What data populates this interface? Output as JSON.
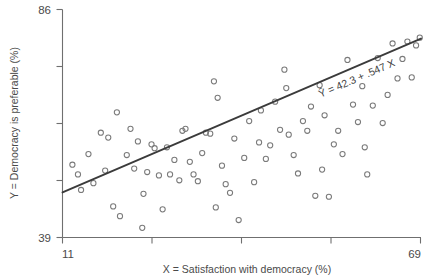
{
  "chart_data": {
    "type": "scatter",
    "title": "",
    "xlabel": "X = Satisfaction with democracy (%)",
    "ylabel": "Y = Democracy is preferable (%)",
    "xlim": [
      11,
      69
    ],
    "ylim": [
      39,
      86
    ],
    "xticks": [
      11,
      25.5,
      40,
      54.5,
      69
    ],
    "yticks": [
      39,
      50.75,
      62.5,
      74.25,
      86
    ],
    "xtick_labels": [
      "11",
      "",
      "",
      "",
      "69"
    ],
    "ytick_labels": [
      "39",
      "",
      "",
      "",
      "86"
    ],
    "grid": false,
    "legend": "none",
    "marker": "open-circle",
    "annotation": "Ŷ = 42.3 + .547 X",
    "regression": {
      "intercept": 42.3,
      "slope": 0.547,
      "x_start": 11,
      "x_end": 69,
      "y_start": 48.3,
      "y_end": 80.0
    },
    "points": [
      [
        13.5,
        52.0
      ],
      [
        14.0,
        48.8
      ],
      [
        15.2,
        56.2
      ],
      [
        16.0,
        50.2
      ],
      [
        17.2,
        60.6
      ],
      [
        18.4,
        59.6
      ],
      [
        17.9,
        52.8
      ],
      [
        19.2,
        45.4
      ],
      [
        20.3,
        43.4
      ],
      [
        21.4,
        56.0
      ],
      [
        22.0,
        61.4
      ],
      [
        22.6,
        53.2
      ],
      [
        23.2,
        58.8
      ],
      [
        23.9,
        41.0
      ],
      [
        24.7,
        52.5
      ],
      [
        25.4,
        58.2
      ],
      [
        25.9,
        57.4
      ],
      [
        26.6,
        51.8
      ],
      [
        27.2,
        44.8
      ],
      [
        27.9,
        57.6
      ],
      [
        28.4,
        52.0
      ],
      [
        29.1,
        55.0
      ],
      [
        29.9,
        50.8
      ],
      [
        30.4,
        61.0
      ],
      [
        30.9,
        61.4
      ],
      [
        31.6,
        54.6
      ],
      [
        32.2,
        52.0
      ],
      [
        32.9,
        50.6
      ],
      [
        33.6,
        56.4
      ],
      [
        34.2,
        60.6
      ],
      [
        34.9,
        60.4
      ],
      [
        35.5,
        71.2
      ],
      [
        36.1,
        67.8
      ],
      [
        36.8,
        53.8
      ],
      [
        37.4,
        50.0
      ],
      [
        38.1,
        48.2
      ],
      [
        38.8,
        59.4
      ],
      [
        39.5,
        42.6
      ],
      [
        40.4,
        55.4
      ],
      [
        41.2,
        63.0
      ],
      [
        42.0,
        50.4
      ],
      [
        43.1,
        65.2
      ],
      [
        43.9,
        55.2
      ],
      [
        44.6,
        58.0
      ],
      [
        45.4,
        67.0
      ],
      [
        46.2,
        61.2
      ],
      [
        46.9,
        73.6
      ],
      [
        47.6,
        60.2
      ],
      [
        48.4,
        56.0
      ],
      [
        49.1,
        52.2
      ],
      [
        49.9,
        63.0
      ],
      [
        50.6,
        61.0
      ],
      [
        51.2,
        66.0
      ],
      [
        51.9,
        47.6
      ],
      [
        52.6,
        70.4
      ],
      [
        53.4,
        64.2
      ],
      [
        54.1,
        47.4
      ],
      [
        54.9,
        58.2
      ],
      [
        55.6,
        61.0
      ],
      [
        56.3,
        56.2
      ],
      [
        57.1,
        75.6
      ],
      [
        58.0,
        66.4
      ],
      [
        58.8,
        62.8
      ],
      [
        59.5,
        70.2
      ],
      [
        60.3,
        52.0
      ],
      [
        61.2,
        66.2
      ],
      [
        62.0,
        76.0
      ],
      [
        62.8,
        62.6
      ],
      [
        63.6,
        68.4
      ],
      [
        64.4,
        79.0
      ],
      [
        65.2,
        71.8
      ],
      [
        66.0,
        75.8
      ],
      [
        66.8,
        79.4
      ],
      [
        67.5,
        72.0
      ],
      [
        68.2,
        78.6
      ],
      [
        68.8,
        80.2
      ],
      [
        12.6,
        54.0
      ],
      [
        19.8,
        64.8
      ],
      [
        24.1,
        48.0
      ],
      [
        35.8,
        45.2
      ],
      [
        42.8,
        58.6
      ],
      [
        47.2,
        69.8
      ],
      [
        53.0,
        53.0
      ],
      [
        59.9,
        57.6
      ]
    ]
  },
  "axis": {
    "x_min_label": "11",
    "x_max_label": "69",
    "y_min_label": "39",
    "y_max_label": "86"
  }
}
